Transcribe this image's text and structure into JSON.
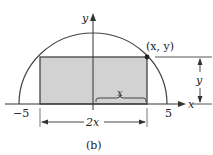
{
  "figure": {
    "caption": "(b)",
    "axes": {
      "x_label": "x",
      "y_label": "y"
    },
    "ticks": {
      "left": "−5",
      "right": "5"
    },
    "point_label": "(x, y)",
    "dimensions": {
      "half_width": "x",
      "full_width": "2x",
      "height": "y"
    },
    "colors": {
      "rect_fill": "#d2d2d2",
      "stroke": "#333333",
      "point": "#222222"
    }
  }
}
